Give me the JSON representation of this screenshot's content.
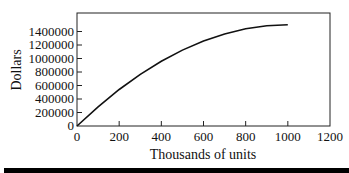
{
  "chart_data": {
    "type": "line",
    "title": "",
    "xlabel": "Thousands of units",
    "ylabel": "Dollars",
    "xlim": [
      0,
      1200
    ],
    "ylim": [
      0,
      1600000
    ],
    "x_ticks": [
      0,
      200,
      400,
      600,
      800,
      1000,
      1200
    ],
    "y_ticks": [
      0,
      200000,
      400000,
      600000,
      800000,
      1000000,
      1200000,
      1400000
    ],
    "x_tick_labels": [
      "0",
      "200",
      "400",
      "600",
      "800",
      "1000",
      "1200"
    ],
    "y_tick_labels": [
      "0",
      "200000",
      "400000",
      "600000",
      "800000",
      "1000000",
      "1200000",
      "1400000"
    ],
    "grid": false,
    "legend": null,
    "series": [
      {
        "name": "Dollars",
        "x": [
          0,
          100,
          200,
          300,
          400,
          500,
          600,
          700,
          800,
          900,
          1000
        ],
        "values": [
          0,
          285000,
          540000,
          765000,
          960000,
          1125000,
          1260000,
          1365000,
          1440000,
          1485000,
          1500000
        ]
      }
    ]
  }
}
